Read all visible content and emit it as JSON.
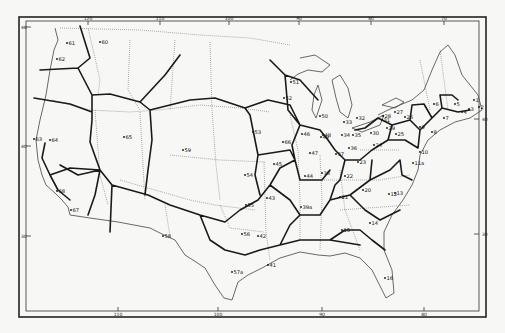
{
  "map": {
    "title": "",
    "longitude_ticks": [
      {
        "label": "120",
        "x": 88,
        "pos": "top"
      },
      {
        "label": "110",
        "x": 160,
        "pos": "top"
      },
      {
        "label": "100",
        "x": 229,
        "pos": "top"
      },
      {
        "label": "90",
        "x": 299,
        "pos": "top"
      },
      {
        "label": "80",
        "x": 371,
        "pos": "top"
      },
      {
        "label": "70",
        "x": 444,
        "pos": "top"
      },
      {
        "label": "110",
        "x": 118,
        "pos": "bottom"
      },
      {
        "label": "100",
        "x": 218,
        "pos": "bottom"
      },
      {
        "label": "90",
        "x": 322,
        "pos": "bottom"
      },
      {
        "label": "80",
        "x": 424,
        "pos": "bottom"
      }
    ],
    "latitude_ticks": [
      {
        "label": "48",
        "y": 27,
        "side": "left"
      },
      {
        "label": "40",
        "y": 146,
        "side": "left"
      },
      {
        "label": "30",
        "y": 236,
        "side": "left"
      },
      {
        "label": "40",
        "y": 119,
        "side": "right"
      },
      {
        "label": "30",
        "y": 234,
        "side": "right"
      }
    ],
    "regions": [
      {
        "id": "1",
        "x": 474,
        "y": 100
      },
      {
        "id": "2",
        "x": 479,
        "y": 107
      },
      {
        "id": "3",
        "x": 469,
        "y": 109
      },
      {
        "id": "4",
        "x": 462,
        "y": 112
      },
      {
        "id": "5",
        "x": 455,
        "y": 104
      },
      {
        "id": "6",
        "x": 434,
        "y": 104
      },
      {
        "id": "7",
        "x": 444,
        "y": 118
      },
      {
        "id": "8",
        "x": 432,
        "y": 132
      },
      {
        "id": "9",
        "x": 420,
        "y": 127
      },
      {
        "id": "10",
        "x": 420,
        "y": 152
      },
      {
        "id": "11a",
        "x": 413,
        "y": 163
      },
      {
        "id": "12",
        "x": 389,
        "y": 194
      },
      {
        "id": "13",
        "x": 395,
        "y": 193
      },
      {
        "id": "14",
        "x": 370,
        "y": 223
      },
      {
        "id": "15",
        "x": 342,
        "y": 230
      },
      {
        "id": "16",
        "x": 385,
        "y": 278
      },
      {
        "id": "20",
        "x": 363,
        "y": 190
      },
      {
        "id": "21",
        "x": 340,
        "y": 197
      },
      {
        "id": "22",
        "x": 345,
        "y": 176
      },
      {
        "id": "23",
        "x": 358,
        "y": 162
      },
      {
        "id": "24",
        "x": 374,
        "y": 145
      },
      {
        "id": "25",
        "x": 396,
        "y": 134
      },
      {
        "id": "26",
        "x": 405,
        "y": 117
      },
      {
        "id": "27",
        "x": 395,
        "y": 112
      },
      {
        "id": "28",
        "x": 383,
        "y": 116
      },
      {
        "id": "29",
        "x": 387,
        "y": 128
      },
      {
        "id": "30",
        "x": 371,
        "y": 133
      },
      {
        "id": "31",
        "x": 382,
        "y": 120
      },
      {
        "id": "32",
        "x": 357,
        "y": 118
      },
      {
        "id": "33",
        "x": 344,
        "y": 122
      },
      {
        "id": "34",
        "x": 342,
        "y": 135
      },
      {
        "id": "35",
        "x": 353,
        "y": 135
      },
      {
        "id": "36",
        "x": 349,
        "y": 148
      },
      {
        "id": "37",
        "x": 336,
        "y": 154
      },
      {
        "id": "38",
        "x": 322,
        "y": 173
      },
      {
        "id": "39a",
        "x": 301,
        "y": 207
      },
      {
        "id": "41",
        "x": 268,
        "y": 265
      },
      {
        "id": "42",
        "x": 258,
        "y": 236
      },
      {
        "id": "43",
        "x": 267,
        "y": 198
      },
      {
        "id": "44",
        "x": 305,
        "y": 176
      },
      {
        "id": "45",
        "x": 274,
        "y": 164
      },
      {
        "id": "46",
        "x": 302,
        "y": 134
      },
      {
        "id": "47",
        "x": 310,
        "y": 153
      },
      {
        "id": "48",
        "x": 323,
        "y": 135
      },
      {
        "id": "49",
        "x": 321,
        "y": 137
      },
      {
        "id": "50",
        "x": 320,
        "y": 116
      },
      {
        "id": "51",
        "x": 291,
        "y": 82
      },
      {
        "id": "52",
        "x": 284,
        "y": 98
      },
      {
        "id": "53",
        "x": 253,
        "y": 132
      },
      {
        "id": "54",
        "x": 245,
        "y": 175
      },
      {
        "id": "55",
        "x": 246,
        "y": 205
      },
      {
        "id": "56",
        "x": 242,
        "y": 234
      },
      {
        "id": "57a",
        "x": 232,
        "y": 272
      },
      {
        "id": "58",
        "x": 163,
        "y": 236
      },
      {
        "id": "59",
        "x": 183,
        "y": 150
      },
      {
        "id": "60",
        "x": 100,
        "y": 42
      },
      {
        "id": "61",
        "x": 67,
        "y": 43
      },
      {
        "id": "62",
        "x": 57,
        "y": 59
      },
      {
        "id": "63",
        "x": 34,
        "y": 139
      },
      {
        "id": "64",
        "x": 50,
        "y": 140
      },
      {
        "id": "65",
        "x": 124,
        "y": 137
      },
      {
        "id": "66",
        "x": 283,
        "y": 142
      },
      {
        "id": "67",
        "x": 71,
        "y": 210
      },
      {
        "id": "68",
        "x": 57,
        "y": 191
      }
    ]
  }
}
